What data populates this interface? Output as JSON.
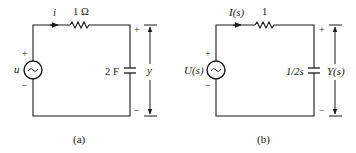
{
  "figure": {
    "panels": [
      {
        "id": "a",
        "caption": "(a)",
        "current_label": "i",
        "resistor_label": "1 Ω",
        "source_label": "u",
        "source_symbol": "~",
        "capacitor_label": "2 F",
        "output_label": "y",
        "plus": "+",
        "minus": "−"
      },
      {
        "id": "b",
        "caption": "(b)",
        "current_label": "I(s)",
        "resistor_label": "1",
        "source_label": "U(s)",
        "source_symbol": "~",
        "capacitor_label": "1/2s",
        "output_label": "Y(s)",
        "plus": "+",
        "minus": "−"
      }
    ],
    "colors": {
      "ink": "#1a1a1a",
      "background": "#ffffff"
    }
  }
}
